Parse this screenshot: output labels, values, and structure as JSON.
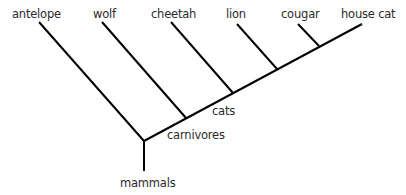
{
  "diagram": {
    "type": "cladogram",
    "line_color": "#000000",
    "text_color": "#2a2a2a",
    "leaves": [
      {
        "label": "antelope",
        "x": 12,
        "y": 8
      },
      {
        "label": "wolf",
        "x": 93,
        "y": 8
      },
      {
        "label": "cheetah",
        "x": 151,
        "y": 8
      },
      {
        "label": "lion",
        "x": 226,
        "y": 8
      },
      {
        "label": "cougar",
        "x": 281,
        "y": 8
      },
      {
        "label": "house cat",
        "x": 341,
        "y": 8
      }
    ],
    "nodes": [
      {
        "label": "cats",
        "x": 212,
        "y": 103
      },
      {
        "label": "carnivores",
        "x": 167,
        "y": 129
      },
      {
        "label": "mammals",
        "x": 120,
        "y": 177
      }
    ],
    "edges": [
      {
        "name": "root-stem",
        "x1": 144,
        "y1": 171,
        "x2": 144,
        "y2": 141
      },
      {
        "name": "antelope-branch",
        "x1": 39,
        "y1": 22,
        "x2": 144,
        "y2": 141
      },
      {
        "name": "main-spine",
        "x1": 144,
        "y1": 141,
        "x2": 362,
        "y2": 24
      },
      {
        "name": "wolf-branch",
        "x1": 102,
        "y1": 22,
        "x2": 186,
        "y2": 118
      },
      {
        "name": "cheetah-branch",
        "x1": 171,
        "y1": 22,
        "x2": 233,
        "y2": 93
      },
      {
        "name": "lion-branch",
        "x1": 237,
        "y1": 24,
        "x2": 277,
        "y2": 69
      },
      {
        "name": "cougar-branch",
        "x1": 298,
        "y1": 24,
        "x2": 319,
        "y2": 46
      }
    ]
  }
}
